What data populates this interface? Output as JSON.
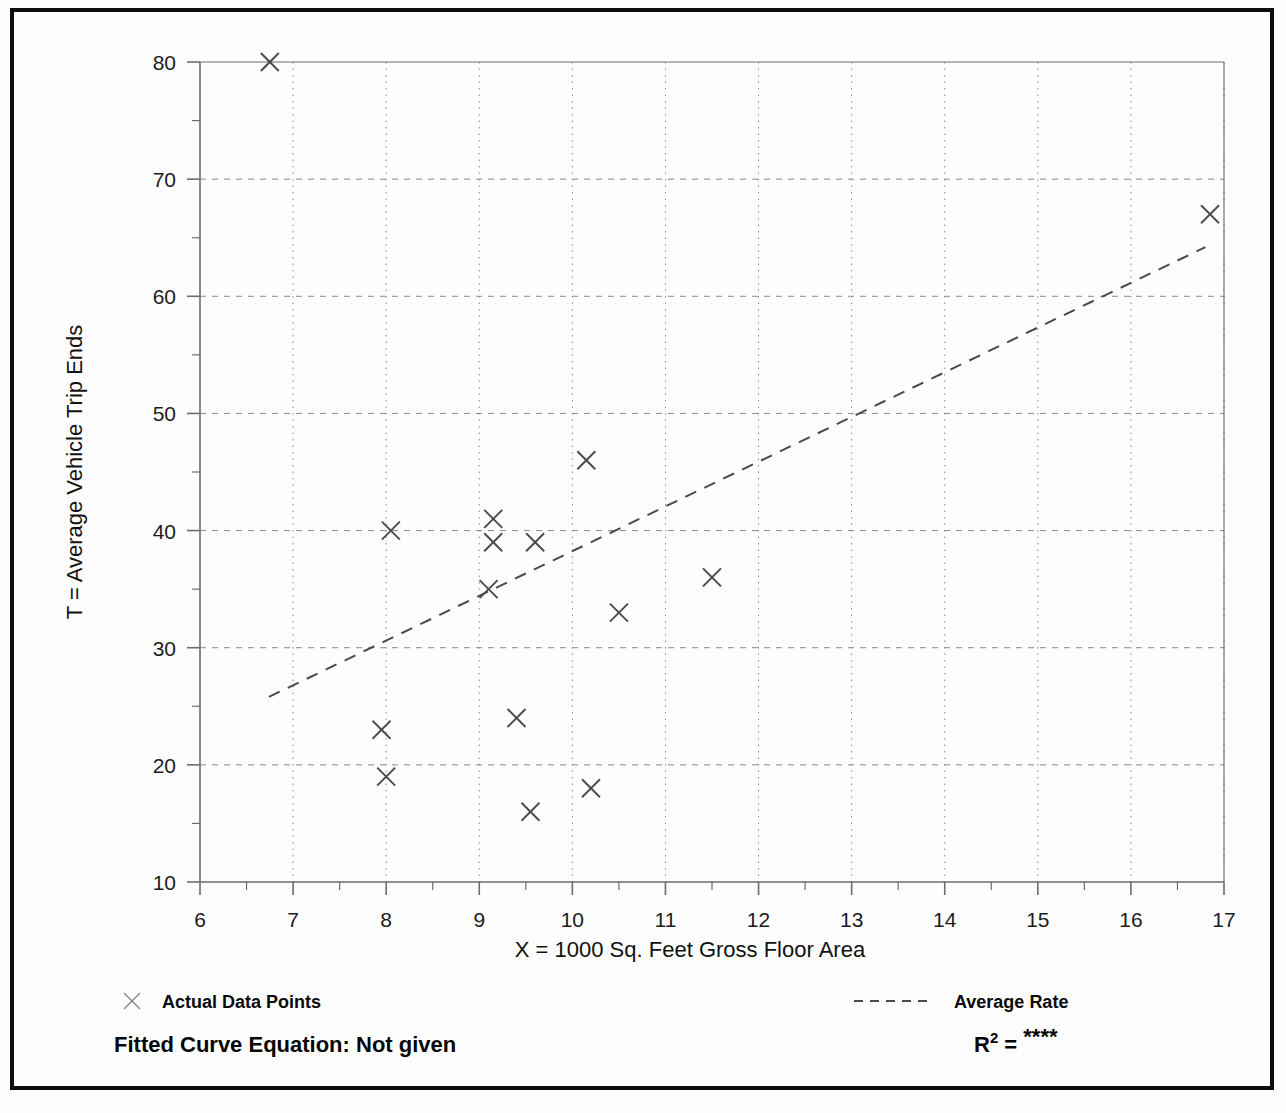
{
  "chart_data": {
    "type": "scatter",
    "title": "",
    "xlabel": "X = 1000 Sq. Feet Gross Floor Area",
    "ylabel": "T = Average Vehicle Trip Ends",
    "xlim": [
      6,
      17
    ],
    "ylim": [
      10,
      80
    ],
    "x_ticks": [
      6,
      7,
      8,
      9,
      10,
      11,
      12,
      13,
      14,
      15,
      16,
      17
    ],
    "x_tick_labels": [
      "6",
      "7",
      "8",
      "9",
      "10",
      "11",
      "12",
      "13",
      "14",
      "15",
      "16",
      "17"
    ],
    "y_ticks": [
      10,
      20,
      30,
      40,
      50,
      60,
      70,
      80
    ],
    "y_tick_labels": [
      "10",
      "20",
      "30",
      "40",
      "50",
      "60",
      "70",
      "80"
    ],
    "x_minor_step": 0.5,
    "y_minor_step": 5,
    "grid": true,
    "grid_style": "dotted",
    "legend_position": "below-plot",
    "series": [
      {
        "name": "Actual Data Points",
        "type": "scatter",
        "marker": "x",
        "points": [
          {
            "x": 6.75,
            "y": 80
          },
          {
            "x": 8.05,
            "y": 40
          },
          {
            "x": 9.15,
            "y": 41
          },
          {
            "x": 9.15,
            "y": 39
          },
          {
            "x": 9.6,
            "y": 39
          },
          {
            "x": 10.15,
            "y": 46
          },
          {
            "x": 9.1,
            "y": 35
          },
          {
            "x": 10.5,
            "y": 33
          },
          {
            "x": 11.5,
            "y": 36
          },
          {
            "x": 7.95,
            "y": 23
          },
          {
            "x": 8.0,
            "y": 19
          },
          {
            "x": 9.4,
            "y": 24
          },
          {
            "x": 9.55,
            "y": 16
          },
          {
            "x": 10.2,
            "y": 18
          },
          {
            "x": 16.85,
            "y": 67
          }
        ]
      },
      {
        "name": "Average Rate",
        "type": "line",
        "style": "dashed",
        "endpoints": [
          {
            "x": 6.74,
            "y": 25.8
          },
          {
            "x": 16.8,
            "y": 64.2
          }
        ]
      }
    ]
  },
  "legend": {
    "data_points_label": "Actual Data Points",
    "data_points_marker": "x-marker-icon",
    "average_rate_label": "Average Rate",
    "average_rate_marker": "dashed-line-icon"
  },
  "footer": {
    "fitted_curve_label": "Fitted Curve Equation:  Not given",
    "r2_base": "R",
    "r2_exponent": "2",
    "r2_equals": " = ",
    "r2_value": "****"
  },
  "colors": {
    "frame": "#0d0d0d",
    "axis": "#6d6d6d",
    "grid": "#8a8a8a",
    "marker": "#4a4a4a",
    "trendline": "#4a4a4a",
    "text": "#111111",
    "background": "#fdfdfd"
  }
}
